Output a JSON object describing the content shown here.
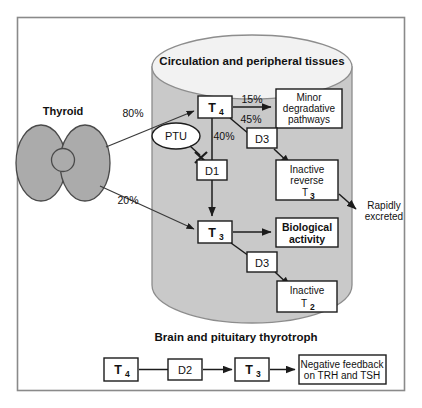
{
  "figure": {
    "colors": {
      "cylinder_body": "#c9c9c9",
      "cylinder_top": "#f2f2f2",
      "thyroid_fill": "#ababab",
      "frame_stroke": "#8a8a8a",
      "line": "#1c1c1c"
    }
  },
  "labels": {
    "thyroid": "Thyroid",
    "circulation_header": "Circulation and peripheral tissues",
    "brain_header": "Brain and pituitary thyrotroph",
    "rapidly_excreted_line1": "Rapidly",
    "rapidly_excreted_line2": "excreted"
  },
  "nodes": {
    "t4_circulation": {
      "base": "T",
      "sub": "4"
    },
    "t3_circulation": {
      "base": "T",
      "sub": "3"
    },
    "t4_brain": {
      "base": "T",
      "sub": "4"
    },
    "t3_brain": {
      "base": "T",
      "sub": "3"
    }
  },
  "enzymes": {
    "ptu": "PTU",
    "d1": "D1",
    "d2": "D2",
    "d3_upper": "D3",
    "d3_lower": "D3"
  },
  "percentages": {
    "to_t4": "80%",
    "to_t3": "20%",
    "t4_to_minor": "15%",
    "t4_to_d3": "45%",
    "t4_to_d1": "40%"
  },
  "boxes": {
    "minor_degradative": {
      "line1": "Minor",
      "line2": "degradative",
      "line3": "pathways"
    },
    "inactive_reverse_t3": {
      "line1": "Inactive",
      "line2": "reverse",
      "line3_base": "T",
      "line3_sub": "3"
    },
    "biological_activity": {
      "line1": "Biological",
      "line2": "activity"
    },
    "inactive_t2": {
      "line1": "Inactive",
      "line2_base": "T",
      "line2_sub": "2"
    },
    "negative_feedback": {
      "line1": "Negative feedback",
      "line2": "on TRH and TSH"
    }
  }
}
